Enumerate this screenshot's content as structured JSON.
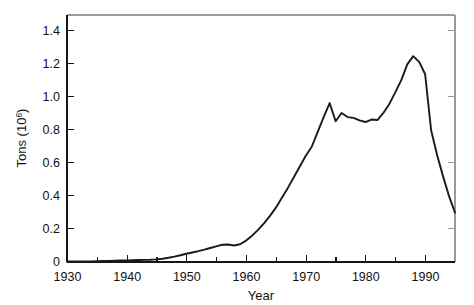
{
  "chart_data": {
    "type": "line",
    "title": "",
    "xlabel": "Year",
    "ylabel": "Tons (10⁶)",
    "ylabel_base": "Tons (10",
    "ylabel_exponent": "6",
    "ylabel_close": ")",
    "xlim": [
      1930,
      1995
    ],
    "ylim": [
      0,
      1.5
    ],
    "grid": false,
    "legend": null,
    "x_major_ticks": [
      1930,
      1940,
      1950,
      1960,
      1970,
      1980,
      1990
    ],
    "x_major_tick_labels": [
      "1930",
      "1940",
      "1950",
      "1960",
      "1970",
      "1980",
      "1990"
    ],
    "x_minor_ticks": [
      1935,
      1945,
      1955,
      1965,
      1975,
      1985,
      1995
    ],
    "y_major_ticks": [
      0,
      0.2,
      0.4,
      0.6,
      0.8,
      1.0,
      1.2,
      1.4
    ],
    "y_major_tick_labels": [
      "0",
      "0.2",
      "0.4",
      "0.6",
      "0.8",
      "1.0",
      "1.2",
      "1.4"
    ],
    "line_color": "#1a1a1a",
    "axis_color": "#151515",
    "background_color": "#ffffff",
    "series": [
      {
        "name": "Tons",
        "x": [
          1930,
          1931,
          1932,
          1933,
          1934,
          1935,
          1936,
          1937,
          1938,
          1939,
          1940,
          1941,
          1942,
          1943,
          1944,
          1945,
          1946,
          1947,
          1948,
          1949,
          1950,
          1951,
          1952,
          1953,
          1954,
          1955,
          1956,
          1957,
          1958,
          1959,
          1960,
          1961,
          1962,
          1963,
          1964,
          1965,
          1966,
          1967,
          1968,
          1969,
          1970,
          1971,
          1972,
          1973,
          1974,
          1975,
          1976,
          1977,
          1978,
          1979,
          1980,
          1981,
          1982,
          1983,
          1984,
          1985,
          1986,
          1987,
          1988,
          1989,
          1990,
          1991,
          1992,
          1993,
          1994,
          1995
        ],
        "values": [
          0.003,
          0.003,
          0.003,
          0.004,
          0.004,
          0.005,
          0.006,
          0.007,
          0.008,
          0.009,
          0.01,
          0.011,
          0.012,
          0.013,
          0.014,
          0.016,
          0.02,
          0.026,
          0.033,
          0.041,
          0.05,
          0.058,
          0.066,
          0.075,
          0.085,
          0.095,
          0.105,
          0.106,
          0.1,
          0.108,
          0.13,
          0.16,
          0.195,
          0.235,
          0.28,
          0.33,
          0.39,
          0.45,
          0.515,
          0.58,
          0.645,
          0.7,
          0.79,
          0.88,
          0.965,
          0.855,
          0.905,
          0.88,
          0.875,
          0.86,
          0.85,
          0.865,
          0.862,
          0.905,
          0.96,
          1.03,
          1.105,
          1.2,
          1.25,
          1.215,
          1.14,
          0.8,
          0.65,
          0.52,
          0.4,
          0.3
        ]
      }
    ]
  },
  "axes": {
    "x_title": "Year",
    "y_title": "Tons (10⁶)"
  }
}
